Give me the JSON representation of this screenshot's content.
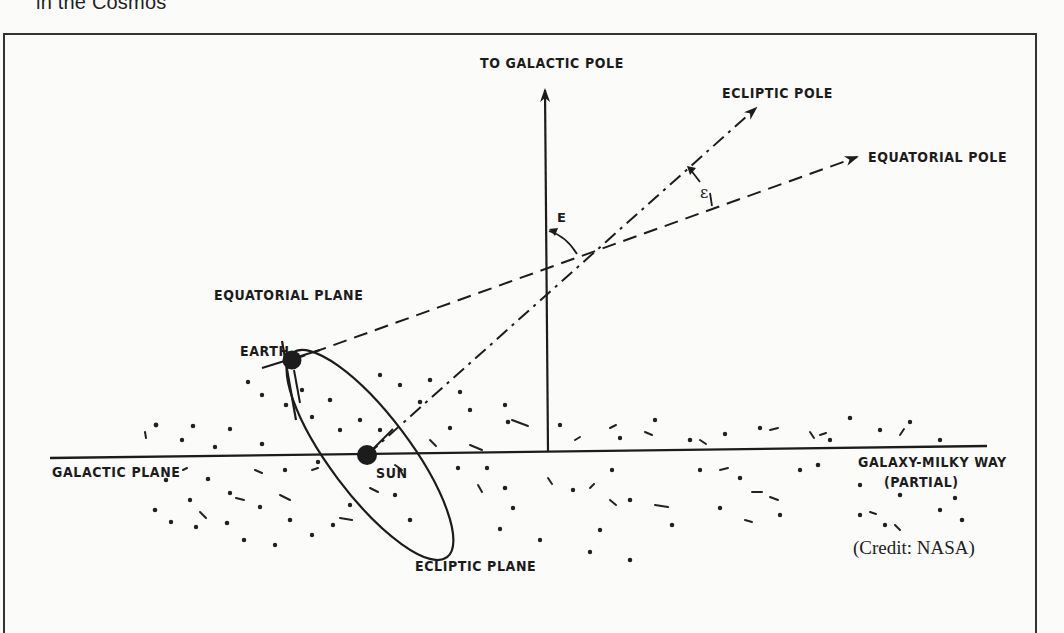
{
  "page": {
    "running_head": "in the Cosmos"
  },
  "figure": {
    "credit": "(Credit: NASA)",
    "labels": {
      "galactic_pole": "TO GALACTIC POLE",
      "ecliptic_pole": "ECLIPTIC POLE",
      "equatorial_pole": "EQUATORIAL POLE",
      "equatorial_plane": "EQUATORIAL PLANE",
      "earth": "EARTH",
      "sun": "SUN",
      "galactic_plane": "GALACTIC PLANE",
      "galaxy_line1": "GALAXY-MILKY WAY",
      "galaxy_line2": "(PARTIAL)",
      "ecliptic_plane": "ECLIPTIC PLANE",
      "angle_E": "E",
      "angle_epsilon": "ε"
    },
    "colors": {
      "ink": "#1c1c1c",
      "paper": "#fbfbfa",
      "frame": "#333333"
    }
  }
}
